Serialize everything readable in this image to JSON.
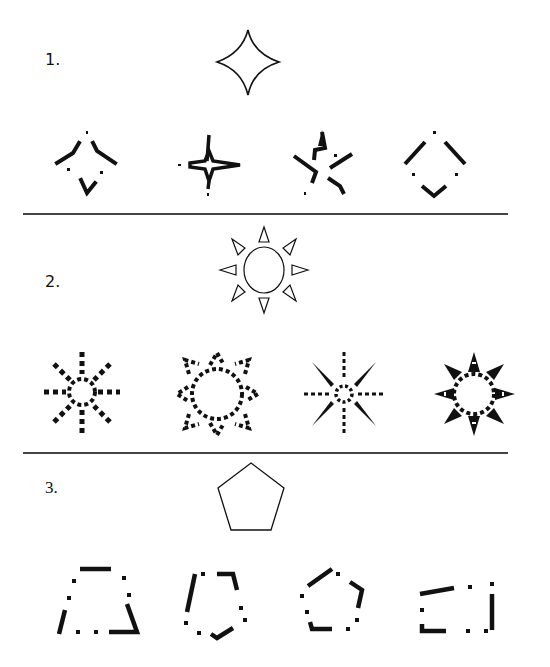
{
  "problems": [
    {
      "number_label": "1.",
      "target_shape": "four-pointed-star",
      "option_count": 4,
      "options": [
        "fragmented-diamond-star",
        "overlapping-four-star",
        "fragmented-five-star",
        "fragmented-diamond"
      ]
    },
    {
      "number_label": "2.",
      "target_shape": "sun-circle-with-eight-triangles",
      "option_count": 4,
      "options": [
        "dotted-sun-spikes",
        "dotted-ring-sun",
        "thin-spike-sun",
        "dotted-spiky-sun"
      ]
    },
    {
      "number_label": "3.",
      "target_shape": "pentagon",
      "option_count": 4,
      "options": [
        "fragmented-trapezoid",
        "fragmented-tilted-pentagon",
        "fragmented-pentagon",
        "fragmented-rectangle"
      ]
    }
  ],
  "colors": {
    "ink": "#111111",
    "divider": "#444444",
    "background": "#ffffff"
  }
}
